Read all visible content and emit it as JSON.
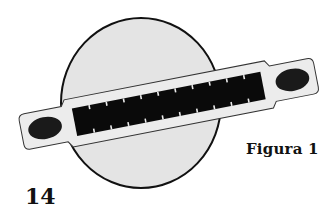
{
  "figure": {
    "label": "Figura 1",
    "page_number": "14",
    "circle": {
      "cx": 141,
      "cy": 103,
      "rx": 80,
      "ry": 85,
      "fill": "#e4e4e4",
      "stroke": "#111111"
    },
    "strip": {
      "fill": "#ececec",
      "stroke": "#333333",
      "angle_deg": -11,
      "pin_count": 11
    },
    "mount_holes": {
      "count": 2,
      "fill": "#1a1a1a"
    },
    "colors": {
      "background": "#ffffff",
      "pins": "#0a0a0a",
      "text": "#111111"
    }
  }
}
